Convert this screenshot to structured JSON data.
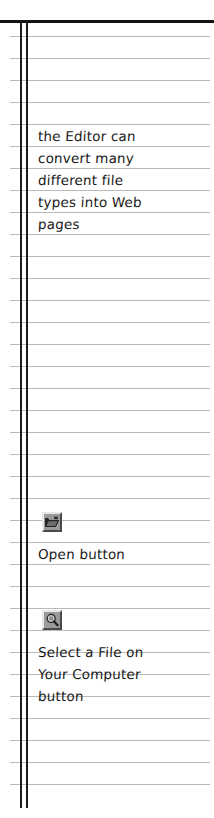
{
  "page": {
    "kind": "lined-notebook-page",
    "background_color": "#ffffff",
    "rule_color": "#b9b9b9",
    "margin_line_color": "#1d1d1d",
    "top_border_color": "#141414",
    "ink_color": "#1a1a1a",
    "rule_spacing_px": 22,
    "first_rule_y": 36,
    "rule_count": 35
  },
  "notes": {
    "paragraph": {
      "lines": [
        "the Editor can",
        "convert many",
        "different file",
        "types into Web",
        "pages"
      ],
      "line_tops": [
        130,
        152,
        174,
        196,
        218
      ]
    },
    "annotations": [
      {
        "icon_name": "open-folder-icon",
        "icon_top": 512,
        "label_lines": [
          "Open button"
        ],
        "label_tops": [
          548
        ]
      },
      {
        "icon_name": "magnifier-browse-icon",
        "icon_top": 610,
        "label_lines": [
          "Select a File on",
          "Your Computer",
          "button"
        ],
        "label_tops": [
          646,
          668,
          690
        ]
      }
    ]
  }
}
